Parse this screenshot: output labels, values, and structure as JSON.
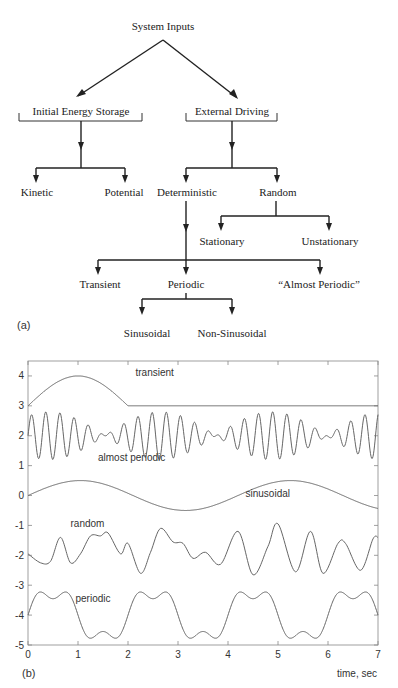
{
  "diagram": {
    "panel_label": "(a)",
    "root": "System Inputs",
    "level1": [
      {
        "label": "Initial Energy Storage",
        "children": [
          "Kinetic",
          "Potential"
        ]
      },
      {
        "label": "External Driving",
        "children": [
          "Deterministic",
          "Random"
        ]
      }
    ],
    "random_children": [
      "Stationary",
      "Unstationary"
    ],
    "deterministic_children": [
      "Transient",
      "Periodic",
      "“Almost Periodic”"
    ],
    "periodic_children": [
      "Sinusoidal",
      "Non-Sinusoidal"
    ]
  },
  "chart_data": {
    "type": "line",
    "panel_label": "(b)",
    "title": "",
    "xlabel": "time, sec",
    "ylabel": "",
    "xlim": [
      0,
      7
    ],
    "ylim": [
      -5,
      4.5
    ],
    "xticks": [
      0,
      1,
      2,
      3,
      4,
      5,
      6,
      7
    ],
    "yticks": [
      4,
      3,
      2,
      1,
      0,
      -1,
      -2,
      -3,
      -4,
      -5
    ],
    "grid": false,
    "legend": "inline labels",
    "series": [
      {
        "name": "transient",
        "label_pos": [
          2.15,
          4.0
        ],
        "description": "3 + sin(pi*t/2) for t<=2, then constant 3",
        "points": [
          [
            0,
            3.0
          ],
          [
            0.5,
            3.71
          ],
          [
            1.0,
            4.0
          ],
          [
            1.5,
            3.71
          ],
          [
            2.0,
            3.0
          ],
          [
            3,
            3.0
          ],
          [
            4,
            3.0
          ],
          [
            5,
            3.0
          ],
          [
            6,
            3.0
          ],
          [
            7,
            3.0
          ]
        ]
      },
      {
        "name": "almost periodic",
        "label_pos": [
          1.4,
          1.15
        ],
        "description": "beating oscillation about 2, amplitude up to ~0.8, carrier ~3.5 Hz, beat period ~2.3 s",
        "center": 2.0,
        "amp": 0.4,
        "f1": 3.3,
        "f2": 3.75
      },
      {
        "name": "sinusoidal",
        "label_pos": [
          4.35,
          -0.05
        ],
        "description": "0.5*sin(2*pi*t/4.2)",
        "center": 0.0,
        "amp": 0.5,
        "period": 4.2,
        "points": [
          [
            0,
            0.0
          ],
          [
            1.05,
            0.5
          ],
          [
            2.1,
            0.0
          ],
          [
            3.15,
            -0.5
          ],
          [
            4.2,
            0.0
          ],
          [
            5.25,
            0.5
          ],
          [
            6.3,
            0.0
          ],
          [
            7,
            -0.43
          ]
        ]
      },
      {
        "name": "random",
        "label_pos": [
          0.85,
          -1.05
        ],
        "description": "irregular signal about -2",
        "points": [
          [
            0,
            -1.95
          ],
          [
            0.25,
            -2.25
          ],
          [
            0.45,
            -2.2
          ],
          [
            0.65,
            -1.4
          ],
          [
            0.85,
            -2.25
          ],
          [
            1.05,
            -1.95
          ],
          [
            1.25,
            -1.35
          ],
          [
            1.45,
            -1.35
          ],
          [
            1.6,
            -1.25
          ],
          [
            1.85,
            -1.95
          ],
          [
            2.0,
            -1.6
          ],
          [
            2.25,
            -2.6
          ],
          [
            2.45,
            -1.9
          ],
          [
            2.65,
            -1.1
          ],
          [
            2.9,
            -1.55
          ],
          [
            3.1,
            -1.6
          ],
          [
            3.3,
            -2.1
          ],
          [
            3.55,
            -1.9
          ],
          [
            3.85,
            -2.3
          ],
          [
            4.2,
            -1.2
          ],
          [
            4.5,
            -2.65
          ],
          [
            4.8,
            -1.7
          ],
          [
            5.0,
            -0.95
          ],
          [
            5.35,
            -2.55
          ],
          [
            5.65,
            -1.2
          ],
          [
            5.9,
            -2.6
          ],
          [
            6.2,
            -1.6
          ],
          [
            6.35,
            -1.6
          ],
          [
            6.65,
            -2.5
          ],
          [
            6.9,
            -1.45
          ],
          [
            7.0,
            -1.4
          ]
        ]
      },
      {
        "name": "periodic",
        "label_pos": [
          0.95,
          -3.55
        ],
        "description": "non-sinusoidal periodic, period 2 s, about -4",
        "center": -4.0,
        "amp": 0.82,
        "period": 2.0
      }
    ]
  }
}
